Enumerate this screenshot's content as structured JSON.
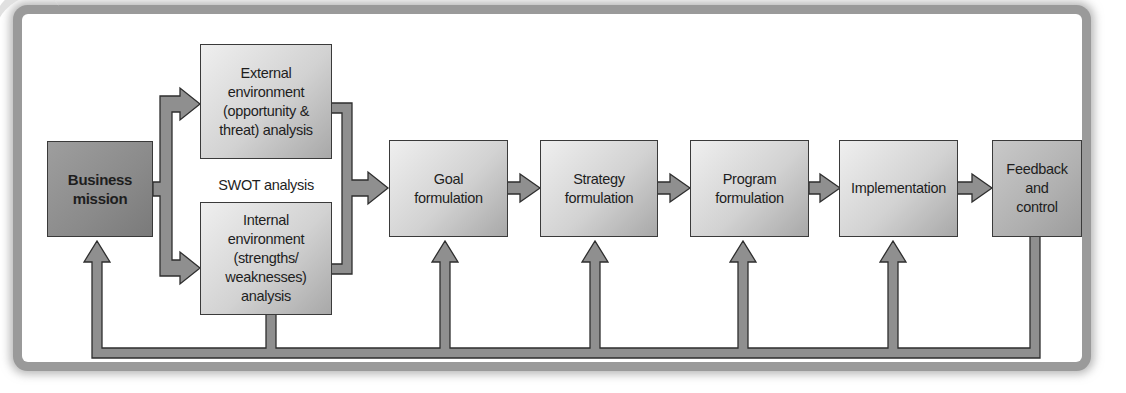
{
  "diagram": {
    "type": "flowchart",
    "nodes": [
      {
        "id": "business-mission",
        "label": "Business\nmission"
      },
      {
        "id": "external-environment",
        "label": "External\nenvironment\n(opportunity &\nthreat) analysis"
      },
      {
        "id": "internal-environment",
        "label": "Internal\nenvironment\n(strengths/\nweaknesses) analysis"
      },
      {
        "id": "goal-formulation",
        "label": "Goal\nformulation"
      },
      {
        "id": "strategy-formulation",
        "label": "Strategy\nformulation"
      },
      {
        "id": "program-formulation",
        "label": "Program\nformulation"
      },
      {
        "id": "implementation",
        "label": "Implementation"
      },
      {
        "id": "feedback-control",
        "label": "Feedback\nand\ncontrol"
      }
    ],
    "group_label": "SWOT analysis",
    "edges": [
      {
        "from": "business-mission",
        "to": "external-environment"
      },
      {
        "from": "business-mission",
        "to": "internal-environment"
      },
      {
        "from": "external-environment",
        "to": "goal-formulation"
      },
      {
        "from": "internal-environment",
        "to": "goal-formulation"
      },
      {
        "from": "goal-formulation",
        "to": "strategy-formulation"
      },
      {
        "from": "strategy-formulation",
        "to": "program-formulation"
      },
      {
        "from": "program-formulation",
        "to": "implementation"
      },
      {
        "from": "implementation",
        "to": "feedback-control"
      },
      {
        "from": "feedback-control",
        "to": "business-mission",
        "type": "feedback"
      },
      {
        "from": "feedback-control",
        "to": "internal-environment",
        "type": "feedback"
      },
      {
        "from": "feedback-control",
        "to": "goal-formulation",
        "type": "feedback"
      },
      {
        "from": "feedback-control",
        "to": "strategy-formulation",
        "type": "feedback"
      },
      {
        "from": "feedback-control",
        "to": "program-formulation",
        "type": "feedback"
      },
      {
        "from": "feedback-control",
        "to": "implementation",
        "type": "feedback"
      }
    ]
  },
  "colors": {
    "arrow_fill": "#8f8f8f",
    "arrow_stroke": "#2e2e2e",
    "frame": "#9a9a9a",
    "box_dark": "#8a8a8a",
    "box_light": "#d2d2d2"
  }
}
